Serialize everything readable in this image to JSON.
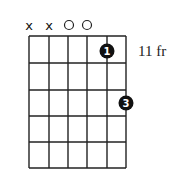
{
  "chord_diagram": {
    "strings": 6,
    "frets": 5,
    "start_fret_label": "11 fr",
    "string_markers": [
      "x",
      "x",
      "o",
      "o",
      "",
      ""
    ],
    "fingers": [
      {
        "string": 5,
        "fret": 1,
        "finger": "1"
      },
      {
        "string": 6,
        "fret": 3,
        "finger": "3"
      }
    ],
    "colors": {
      "grid": "#222222",
      "dot": "#111111",
      "background": "#ffffff"
    }
  }
}
